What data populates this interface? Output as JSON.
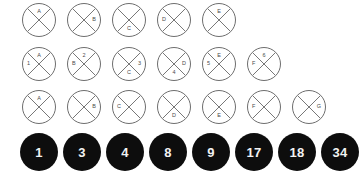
{
  "diagram": {
    "colors": {
      "outline_stroke": "#6e6e6e",
      "label_text": "#4a4a4a",
      "filled_fill": "#0d0d0d",
      "filled_text": "#f2f2f2",
      "background": "#ffffff"
    },
    "rows": [
      {
        "name": "row-1-single-letter-nodes",
        "y": 3,
        "start_x": 22,
        "step_x": 45,
        "diameter": 34,
        "style": "open",
        "nodes": [
          {
            "labels": [
              {
                "text": "A",
                "pos": "top"
              }
            ]
          },
          {
            "labels": [
              {
                "text": "B",
                "pos": "right"
              }
            ]
          },
          {
            "labels": [
              {
                "text": "C",
                "pos": "bottom"
              }
            ]
          },
          {
            "labels": [
              {
                "text": "D",
                "pos": "left"
              }
            ]
          },
          {
            "labels": [
              {
                "text": "E",
                "pos": "top"
              }
            ]
          }
        ]
      },
      {
        "name": "row-2-paired-label-nodes",
        "y": 47,
        "start_x": 22,
        "step_x": 45,
        "diameter": 34,
        "style": "open",
        "nodes": [
          {
            "labels": [
              {
                "text": "A",
                "pos": "top"
              },
              {
                "text": "1",
                "pos": "left"
              }
            ]
          },
          {
            "labels": [
              {
                "text": "2",
                "pos": "top"
              },
              {
                "text": "B",
                "pos": "left"
              }
            ]
          },
          {
            "labels": [
              {
                "text": "3",
                "pos": "right"
              },
              {
                "text": "C",
                "pos": "bottom"
              }
            ]
          },
          {
            "labels": [
              {
                "text": "D",
                "pos": "right"
              },
              {
                "text": "4",
                "pos": "bottom"
              }
            ]
          },
          {
            "labels": [
              {
                "text": "E",
                "pos": "top"
              },
              {
                "text": "5",
                "pos": "left"
              }
            ]
          },
          {
            "labels": [
              {
                "text": "6",
                "pos": "top"
              },
              {
                "text": "F",
                "pos": "left"
              }
            ]
          }
        ]
      },
      {
        "name": "row-3-single-letter-nodes",
        "y": 90,
        "start_x": 22,
        "step_x": 45,
        "diameter": 34,
        "style": "open",
        "nodes": [
          {
            "labels": [
              {
                "text": "A",
                "pos": "top"
              }
            ]
          },
          {
            "labels": [
              {
                "text": "B",
                "pos": "right"
              }
            ]
          },
          {
            "labels": [
              {
                "text": "C",
                "pos": "left"
              }
            ]
          },
          {
            "labels": [
              {
                "text": "D",
                "pos": "bottom"
              }
            ]
          },
          {
            "labels": [
              {
                "text": "E",
                "pos": "bottom"
              }
            ]
          },
          {
            "labels": [
              {
                "text": "F",
                "pos": "left"
              }
            ]
          },
          {
            "labels": [
              {
                "text": "G",
                "pos": "right"
              }
            ]
          }
        ]
      },
      {
        "name": "row-4-filled-number-nodes",
        "y": 133,
        "start_x": 20,
        "step_x": 43,
        "diameter": 38,
        "style": "filled",
        "nodes": [
          {
            "number": "1"
          },
          {
            "number": "3"
          },
          {
            "number": "4"
          },
          {
            "number": "8"
          },
          {
            "number": "9"
          },
          {
            "number": "17"
          },
          {
            "number": "18"
          },
          {
            "number": "34"
          }
        ]
      }
    ]
  }
}
